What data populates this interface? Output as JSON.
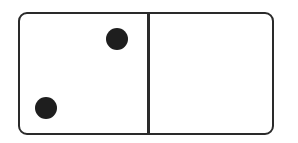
{
  "domino": {
    "left_value": 2,
    "right_value": 0,
    "border_color": "#2a2a2a",
    "pip_color": "#1e1e1e",
    "left_pips": [
      {
        "cx": 117,
        "cy": 39
      },
      {
        "cx": 46,
        "cy": 108
      }
    ],
    "right_pips": []
  }
}
